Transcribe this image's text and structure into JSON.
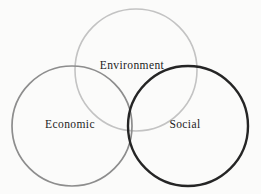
{
  "diagram": {
    "type": "venn",
    "title": "",
    "background_color": "#fbfbfa",
    "width": 261,
    "height": 194,
    "set_count": 3,
    "labels": {
      "environment": "Environment",
      "economic": "Economic",
      "social": "Social"
    },
    "circles": [
      {
        "id": "environment",
        "label": "Environment",
        "cx": 136,
        "cy": 70,
        "r": 61,
        "stroke": "#c3c3c3",
        "stroke_width": 1.6,
        "fill": "none",
        "position": "top-center"
      },
      {
        "id": "economic",
        "label": "Economic",
        "cx": 72,
        "cy": 126,
        "r": 60,
        "stroke": "#8d8d8d",
        "stroke_width": 1.7,
        "fill": "none",
        "position": "bottom-left"
      },
      {
        "id": "social",
        "label": "Social",
        "cx": 188,
        "cy": 126,
        "r": 60,
        "stroke": "#252525",
        "stroke_width": 2.4,
        "fill": "none",
        "position": "bottom-right"
      }
    ],
    "label_positions": [
      {
        "id": "environment",
        "x": 132,
        "y": 66
      },
      {
        "id": "economic",
        "x": 70,
        "y": 125
      },
      {
        "id": "social",
        "x": 185,
        "y": 125
      }
    ]
  }
}
